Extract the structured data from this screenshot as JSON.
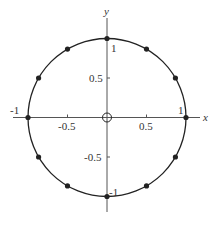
{
  "chart_data": {
    "type": "scatter",
    "title": "",
    "xlabel": "x",
    "ylabel": "y",
    "xlim": [
      -1.2,
      1.18
    ],
    "ylim": [
      -1.2,
      1.26
    ],
    "grid": false,
    "legend": null,
    "x_ticks": [
      -1,
      -0.5,
      0.5,
      1
    ],
    "x_tick_labels": [
      "-1",
      "-0.5",
      "0.5",
      "1"
    ],
    "y_ticks": [
      1,
      0.5,
      -0.5,
      -1
    ],
    "y_tick_labels": [
      "1",
      "0.5",
      "-0.5",
      "-1"
    ],
    "curves": [
      {
        "name": "unit-circle",
        "shape": "circle",
        "center": [
          0,
          0
        ],
        "radius": 1
      }
    ],
    "series": [
      {
        "name": "points-on-unit-circle",
        "marker": "filled-dot",
        "points": [
          {
            "x": 1,
            "y": 0
          },
          {
            "x": 0.866,
            "y": 0.5
          },
          {
            "x": 0.5,
            "y": 0.866
          },
          {
            "x": 0,
            "y": 1
          },
          {
            "x": -0.5,
            "y": 0.866
          },
          {
            "x": -0.866,
            "y": 0.5
          },
          {
            "x": -1,
            "y": 0
          },
          {
            "x": -0.866,
            "y": -0.5
          },
          {
            "x": -0.5,
            "y": -0.866
          },
          {
            "x": 0,
            "y": -1
          },
          {
            "x": 0.5,
            "y": -0.866
          },
          {
            "x": 0.866,
            "y": -0.5
          }
        ]
      },
      {
        "name": "origin",
        "marker": "open-circle",
        "points": [
          {
            "x": 0,
            "y": 0
          }
        ]
      }
    ]
  },
  "labels": {
    "x_axis": "x",
    "y_axis": "y",
    "x_neg1": "-1",
    "x_neg05": "-0.5",
    "x_pos05": "0.5",
    "x_pos1": "1",
    "y_pos1": "1",
    "y_pos05": "0.5",
    "y_neg05": "-0.5",
    "y_neg1": "-1"
  },
  "colors": {
    "ink": "#222222",
    "axis": "#555555",
    "background": "#ffffff"
  }
}
